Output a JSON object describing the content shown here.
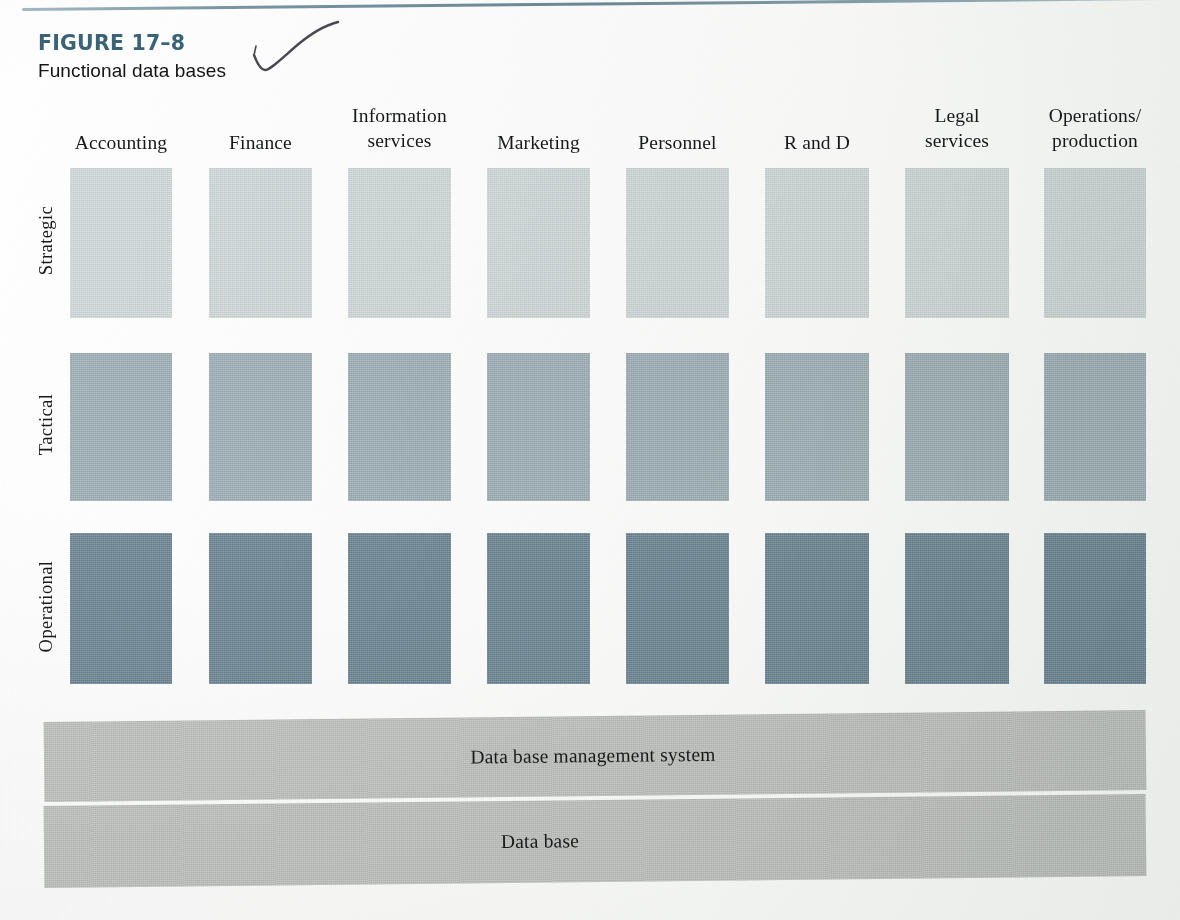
{
  "figure": {
    "number": "FIGURE 17–8",
    "title": "Functional data bases",
    "number_color": "#3a6378",
    "annotation_icon": "handwritten-check-mark"
  },
  "chart_data": {
    "type": "heatmap",
    "title": "Functional data bases",
    "xlabel": "",
    "ylabel": "",
    "grid": false,
    "legend": "none",
    "categories": [
      "Accounting",
      "Finance",
      "Information services",
      "Marketing",
      "Personnel",
      "R and D",
      "Legal services",
      "Operations/ production"
    ],
    "rows": [
      "Strategic",
      "Tactical",
      "Operational"
    ],
    "series": [
      {
        "name": "Strategic",
        "values": [
          1,
          1,
          1,
          1,
          1,
          1,
          1,
          1
        ],
        "color": "#d2dbdc"
      },
      {
        "name": "Tactical",
        "values": [
          2,
          2,
          2,
          2,
          2,
          2,
          2,
          2
        ],
        "color": "#9fb1b9"
      },
      {
        "name": "Operational",
        "values": [
          3,
          3,
          3,
          3,
          3,
          3,
          3,
          3
        ],
        "color": "#6d8795"
      }
    ]
  },
  "columns": [
    {
      "id": "accounting",
      "lines": [
        "Accounting"
      ],
      "x": 70,
      "width": 102
    },
    {
      "id": "finance",
      "lines": [
        "Finance"
      ],
      "x": 209,
      "width": 103
    },
    {
      "id": "information-services",
      "lines": [
        "Information",
        "services"
      ],
      "x": 348,
      "width": 103
    },
    {
      "id": "marketing",
      "lines": [
        "Marketing"
      ],
      "x": 487,
      "width": 103
    },
    {
      "id": "personnel",
      "lines": [
        "Personnel"
      ],
      "x": 626,
      "width": 103
    },
    {
      "id": "r-and-d",
      "lines": [
        "R and D"
      ],
      "x": 765,
      "width": 104
    },
    {
      "id": "legal-services",
      "lines": [
        "Legal",
        "services"
      ],
      "x": 905,
      "width": 104
    },
    {
      "id": "operations-production",
      "lines": [
        "Operations/",
        "production"
      ],
      "x": 1044,
      "width": 102
    }
  ],
  "rows": [
    {
      "id": "strategic",
      "label": "Strategic",
      "y": 168,
      "height": 150,
      "color": "#d2dbdc"
    },
    {
      "id": "tactical",
      "label": "Tactical",
      "y": 353,
      "height": 148,
      "color": "#9fb1b9"
    },
    {
      "id": "operational",
      "label": "Operational",
      "y": 533,
      "height": 151,
      "color": "#6d8795"
    }
  ],
  "layers": [
    {
      "id": "dbms",
      "label": "Data base management system"
    },
    {
      "id": "database",
      "label": "Data base"
    }
  ]
}
